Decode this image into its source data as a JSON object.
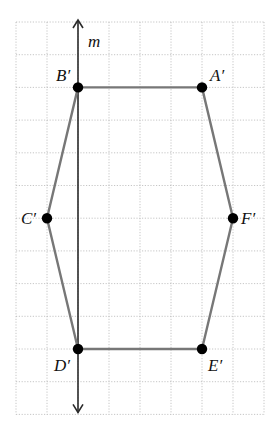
{
  "diagram": {
    "type": "coordinate-grid-polygon",
    "grid": {
      "columns": 8,
      "rows": 12,
      "origin_px": [
        16,
        22
      ],
      "cell_w": 31,
      "cell_h": 32.7,
      "line_color": "#b8b8b8",
      "style": "dotted"
    },
    "axis": {
      "label": "m",
      "column": 2,
      "orientation": "vertical",
      "arrows": "both",
      "color": "#2a2a2a"
    },
    "polygon": {
      "edge_color": "#777777",
      "vertex_color": "#000000",
      "vertices": [
        {
          "name": "A′",
          "col": 6,
          "row": 2,
          "label_dx": 8,
          "label_dy": -6
        },
        {
          "name": "B′",
          "col": 2,
          "row": 2,
          "label_dx": -22,
          "label_dy": -6
        },
        {
          "name": "C′",
          "col": 1,
          "row": 6,
          "label_dx": -26,
          "label_dy": 6
        },
        {
          "name": "D′",
          "col": 2,
          "row": 10,
          "label_dx": -24,
          "label_dy": 22
        },
        {
          "name": "E′",
          "col": 6,
          "row": 10,
          "label_dx": 6,
          "label_dy": 22
        },
        {
          "name": "F′",
          "col": 7,
          "row": 6,
          "label_dx": 8,
          "label_dy": 6
        }
      ],
      "order": [
        "A′",
        "B′",
        "C′",
        "D′",
        "E′",
        "F′"
      ]
    }
  }
}
